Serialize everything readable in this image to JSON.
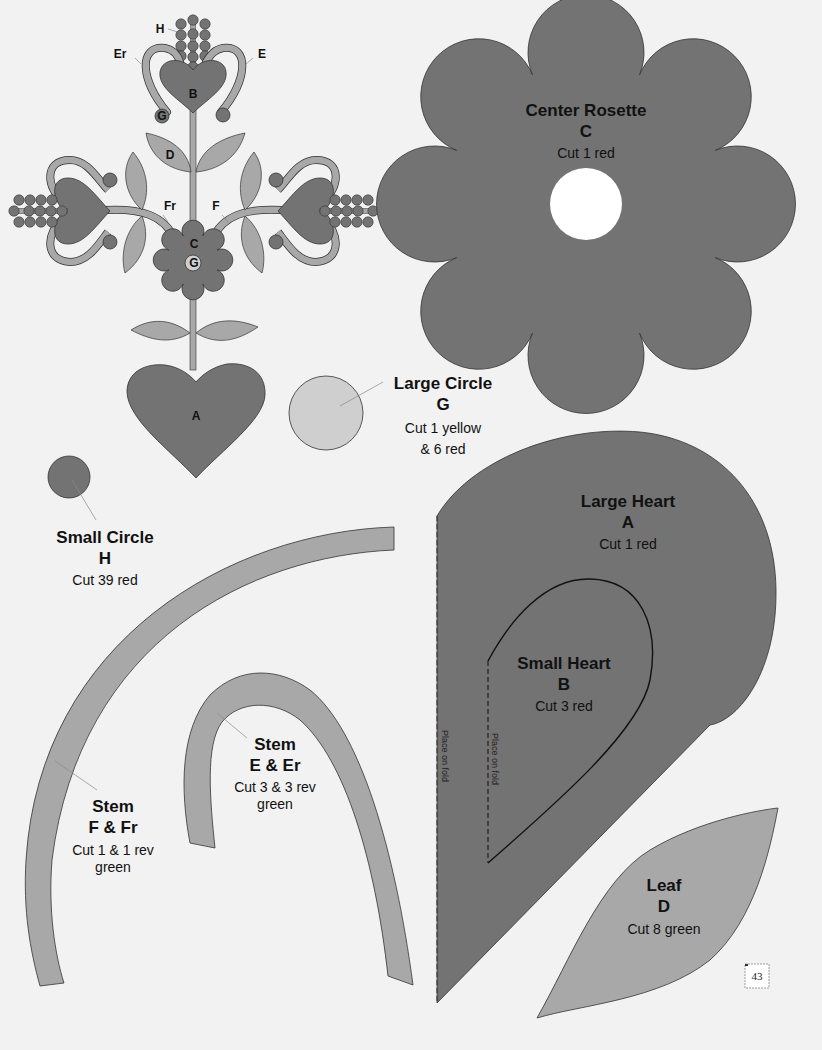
{
  "colors": {
    "red": "#737373",
    "green": "#a8a8a8",
    "yellow": "#cfcfcf",
    "outline": "#333333",
    "paper": "#f2f2f2"
  },
  "mini_diagram": {
    "labels": {
      "H": "H",
      "Er": "Er",
      "E": "E",
      "B": "B",
      "G_top": "G",
      "D": "D",
      "Fr": "Fr",
      "F": "F",
      "C": "C",
      "G_center": "G",
      "A": "A"
    }
  },
  "pieces": {
    "center_rosette": {
      "title": "Center Rosette",
      "letter": "C",
      "cut": "Cut 1 red"
    },
    "large_circle": {
      "title": "Large Circle",
      "letter": "G",
      "cut_line1": "Cut 1 yellow",
      "cut_line2": "& 6 red"
    },
    "small_circle": {
      "title": "Small Circle",
      "letter": "H",
      "cut": "Cut 39 red"
    },
    "large_heart": {
      "title": "Large Heart",
      "letter": "A",
      "cut": "Cut 1 red",
      "fold": "Place on fold"
    },
    "small_heart": {
      "title": "Small Heart",
      "letter": "B",
      "cut": "Cut 3 red",
      "fold": "Place on fold"
    },
    "stem_ef": {
      "title": "Stem",
      "letter": "E & Er",
      "cut_line1": "Cut 3 & 3 rev",
      "cut_line2": "green"
    },
    "stem_ff": {
      "title": "Stem",
      "letter": "F & Fr",
      "cut_line1": "Cut 1 & 1 rev",
      "cut_line2": "green"
    },
    "leaf": {
      "title": "Leaf",
      "letter": "D",
      "cut": "Cut 8 green"
    }
  },
  "page_number": "43"
}
